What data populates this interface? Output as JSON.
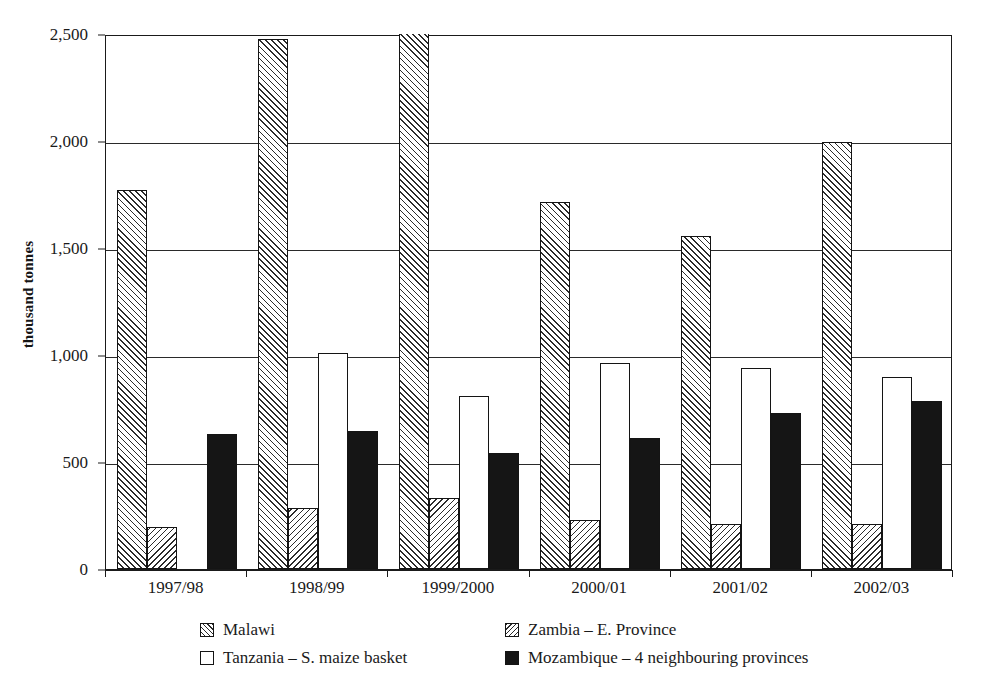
{
  "chart_data": {
    "type": "bar",
    "title": "",
    "subtitle": "",
    "xlabel": "",
    "ylabel": "thousand tonnes",
    "categories": [
      "1997/98",
      "1998/99",
      "1999/2000",
      "2000/01",
      "2001/02",
      "2002/03"
    ],
    "ylim": [
      0,
      2500
    ],
    "y_ticks": [
      0,
      500,
      1000,
      1500,
      2000,
      2500
    ],
    "y_tick_labels": [
      "0",
      "500",
      "1,000",
      "1,500",
      "2,000",
      "2,500"
    ],
    "grid": true,
    "legend_position": "bottom",
    "series": [
      {
        "name": "Malawi",
        "pattern": "forward-diagonal-hatch",
        "values": [
          1770,
          2475,
          2520,
          1715,
          1555,
          1995
        ],
        "clipped": [
          false,
          false,
          true,
          false,
          false,
          false
        ]
      },
      {
        "name": "Zambia – E. Province",
        "pattern": "back-diagonal-hatch",
        "values": [
          195,
          285,
          330,
          230,
          210,
          210
        ],
        "clipped": [
          false,
          false,
          false,
          false,
          false,
          false
        ]
      },
      {
        "name": "Tanzania – S. maize basket",
        "pattern": "white-fill",
        "values": [
          null,
          1010,
          810,
          965,
          940,
          895
        ],
        "clipped": [
          false,
          false,
          false,
          false,
          false,
          false
        ]
      },
      {
        "name": "Mozambique – 4 neighbouring provinces",
        "pattern": "solid-black",
        "values": [
          630,
          645,
          540,
          610,
          730,
          785
        ],
        "clipped": [
          false,
          false,
          false,
          false,
          false,
          false
        ]
      }
    ]
  },
  "legend": {
    "items": [
      {
        "label": "Malawi",
        "pattern": "pattern-malawi"
      },
      {
        "label": "Zambia – E. Province",
        "pattern": "pattern-zambia"
      },
      {
        "label": "Tanzania – S. maize basket",
        "pattern": "pattern-tanzania"
      },
      {
        "label": "Mozambique – 4 neighbouring provinces",
        "pattern": "pattern-mozambique"
      }
    ]
  }
}
